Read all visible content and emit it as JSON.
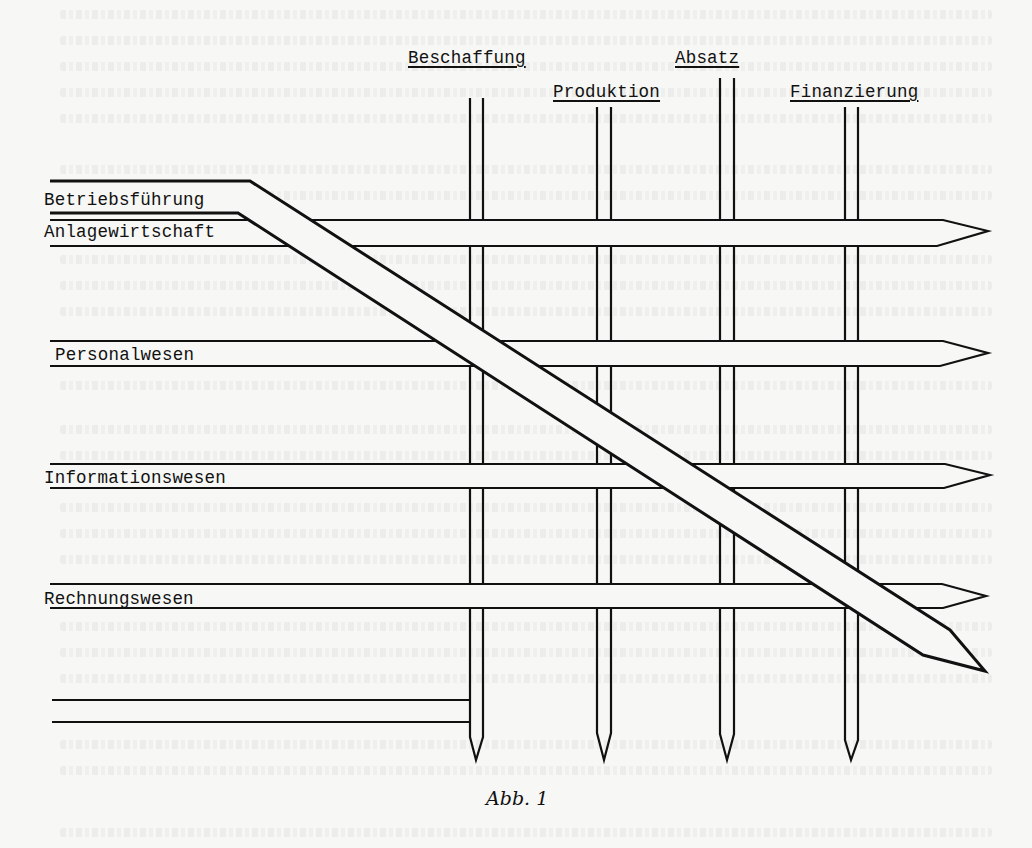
{
  "figure": {
    "caption": "Abb. 1",
    "columns": [
      {
        "id": "beschaffung",
        "label": "Beschaffung"
      },
      {
        "id": "produktion",
        "label": "Produktion"
      },
      {
        "id": "absatz",
        "label": "Absatz"
      },
      {
        "id": "finanzierung",
        "label": "Finanzierung"
      }
    ],
    "rows": [
      {
        "id": "betriebsfuehrung",
        "label": "Betriebsführung"
      },
      {
        "id": "anlagewirtschaft",
        "label": "Anlagewirtschaft"
      },
      {
        "id": "personalwesen",
        "label": "Personalwesen"
      },
      {
        "id": "informationswesen",
        "label": "Informationswesen"
      },
      {
        "id": "rechnungswesen",
        "label": "Rechnungswesen"
      }
    ]
  },
  "colors": {
    "ink": "#111111",
    "paper": "#f7f7f5"
  }
}
